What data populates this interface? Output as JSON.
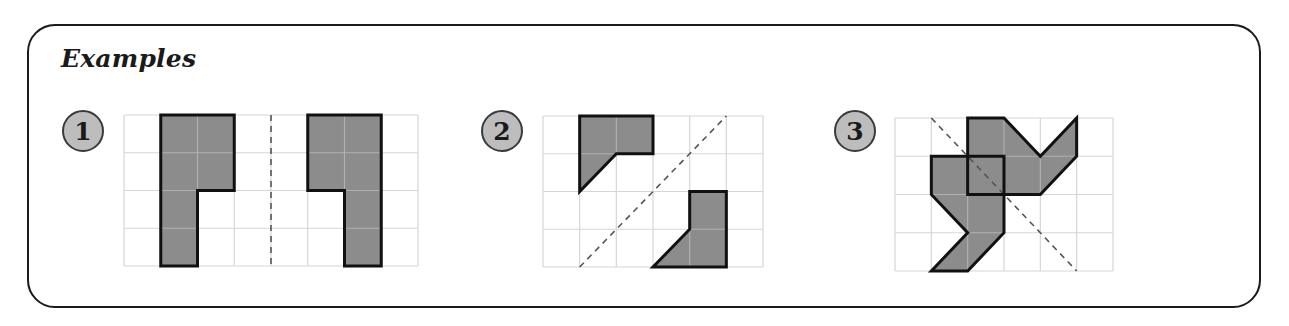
{
  "title": "Examples",
  "colors": {
    "panel_border": "#1a1a1a",
    "grid_line": "#d6d6d6",
    "shape_fill": "#8c8c8c",
    "shape_stroke": "#111111",
    "inner_grid_line": "#b0b0b0",
    "badge_fill": "#bdbdbd",
    "badge_stroke": "#3a3a3a",
    "dash_line": "#555555"
  },
  "examples": [
    {
      "number": "1",
      "badge": {
        "cx": 83,
        "cy": 131,
        "r": 20
      },
      "grid": {
        "x": 124,
        "y": 115,
        "cols": 8,
        "rows": 4,
        "cw": 36.75,
        "ch": 37.75
      },
      "shapes": [
        [
          [
            1,
            0
          ],
          [
            3,
            0
          ],
          [
            3,
            2
          ],
          [
            2,
            2
          ],
          [
            2,
            4
          ],
          [
            1,
            4
          ]
        ],
        [
          [
            5,
            0
          ],
          [
            7,
            0
          ],
          [
            7,
            4
          ],
          [
            6,
            4
          ],
          [
            6,
            2
          ],
          [
            5,
            2
          ]
        ]
      ],
      "axis": {
        "from": [
          4,
          0
        ],
        "to": [
          4,
          4
        ]
      }
    },
    {
      "number": "2",
      "badge": {
        "cx": 502,
        "cy": 131,
        "r": 20
      },
      "grid": {
        "x": 543,
        "y": 116,
        "cols": 6,
        "rows": 4,
        "cw": 36.67,
        "ch": 37.75
      },
      "shapes": [
        [
          [
            1,
            0
          ],
          [
            3,
            0
          ],
          [
            3,
            1
          ],
          [
            2,
            1
          ],
          [
            1,
            2
          ]
        ],
        [
          [
            4,
            2
          ],
          [
            5,
            2
          ],
          [
            5,
            4
          ],
          [
            3,
            4
          ],
          [
            4,
            3
          ]
        ]
      ],
      "axis": {
        "from": [
          1,
          4
        ],
        "to": [
          5,
          0
        ]
      }
    },
    {
      "number": "3",
      "badge": {
        "cx": 855,
        "cy": 131,
        "r": 20
      },
      "grid": {
        "x": 895,
        "y": 118,
        "cols": 6,
        "rows": 4,
        "cw": 36.33,
        "ch": 38.25
      },
      "shapes": [
        [
          [
            2,
            0
          ],
          [
            3,
            0
          ],
          [
            4,
            1
          ],
          [
            5,
            0
          ],
          [
            5,
            1
          ],
          [
            4,
            2
          ],
          [
            2,
            2
          ]
        ],
        [
          [
            1,
            1
          ],
          [
            3,
            1
          ],
          [
            3,
            3
          ],
          [
            2,
            4
          ],
          [
            1,
            4
          ],
          [
            2,
            3
          ],
          [
            1,
            2
          ]
        ]
      ],
      "axis": {
        "from": [
          1,
          0
        ],
        "to": [
          5,
          4
        ]
      }
    }
  ]
}
